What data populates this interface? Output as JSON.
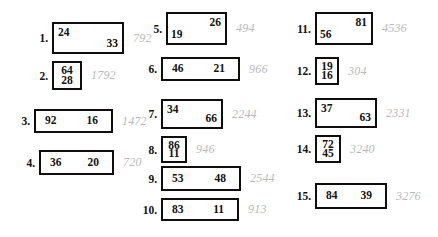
{
  "worksheet": {
    "columns": [
      {
        "name": "column-left",
        "problems": [
          {
            "index": "1.",
            "layout": "diagonal-tl-br",
            "factors": [
              "24",
              "33"
            ],
            "product": "792",
            "box": {
              "width": 72,
              "height": 32
            },
            "pos": {
              "left": 34,
              "top": 22
            },
            "idx_width": 14
          },
          {
            "index": "2.",
            "layout": "stacked",
            "factors": [
              "64",
              "28"
            ],
            "product": "1792",
            "box": {
              "width": 30,
              "height": 29
            },
            "pos": {
              "left": 34,
              "top": 61
            },
            "idx_width": 14
          },
          {
            "index": "3.",
            "layout": "inline",
            "factors": [
              "92",
              "16"
            ],
            "product": "1472",
            "box": {
              "width": 79,
              "height": 24
            },
            "pos": {
              "left": 16,
              "top": 109
            },
            "idx_width": 14
          },
          {
            "index": "4.",
            "layout": "inline",
            "factors": [
              "36",
              "20"
            ],
            "product": "720",
            "box": {
              "width": 75,
              "height": 25
            },
            "pos": {
              "left": 21,
              "top": 150
            },
            "idx_width": 14
          }
        ]
      },
      {
        "name": "column-middle",
        "problems": [
          {
            "index": "5.",
            "layout": "diagonal-tr-bl",
            "factors": [
              "26",
              "19"
            ],
            "product": "494",
            "box": {
              "width": 61,
              "height": 33
            },
            "pos": {
              "left": 148,
              "top": 12
            },
            "idx_width": 14
          },
          {
            "index": "6.",
            "layout": "inline",
            "factors": [
              "46",
              "21"
            ],
            "product": "966",
            "box": {
              "width": 79,
              "height": 24
            },
            "pos": {
              "left": 143,
              "top": 57
            },
            "idx_width": 14
          },
          {
            "index": "7.",
            "layout": "diagonal-tl-br",
            "factors": [
              "34",
              "66"
            ],
            "product": "2244",
            "box": {
              "width": 62,
              "height": 30
            },
            "pos": {
              "left": 143,
              "top": 99
            },
            "idx_width": 14
          },
          {
            "index": "8.",
            "layout": "stacked",
            "factors": [
              "86",
              "11"
            ],
            "product": "946",
            "box": {
              "width": 26,
              "height": 27
            },
            "pos": {
              "left": 143,
              "top": 136
            },
            "idx_width": 14
          },
          {
            "index": "9.",
            "layout": "inline",
            "factors": [
              "53",
              "48"
            ],
            "product": "2544",
            "box": {
              "width": 80,
              "height": 25
            },
            "pos": {
              "left": 143,
              "top": 166
            },
            "idx_width": 14
          },
          {
            "index": "10.",
            "layout": "inline",
            "factors": [
              "83",
              "11"
            ],
            "product": "913",
            "box": {
              "width": 78,
              "height": 23
            },
            "pos": {
              "left": 137,
              "top": 198
            },
            "idx_width": 20
          }
        ]
      },
      {
        "name": "column-right",
        "problems": [
          {
            "index": "11.",
            "layout": "diagonal-tr-bl",
            "factors": [
              "81",
              "56"
            ],
            "product": "4536",
            "box": {
              "width": 58,
              "height": 33
            },
            "pos": {
              "left": 291,
              "top": 12
            },
            "idx_width": 20
          },
          {
            "index": "12.",
            "layout": "stacked",
            "factors": [
              "19",
              "16"
            ],
            "product": "304",
            "box": {
              "width": 24,
              "height": 28
            },
            "pos": {
              "left": 291,
              "top": 57
            },
            "idx_width": 20
          },
          {
            "index": "13.",
            "layout": "diagonal-tl-br",
            "factors": [
              "37",
              "63"
            ],
            "product": "2331",
            "box": {
              "width": 62,
              "height": 30
            },
            "pos": {
              "left": 291,
              "top": 98
            },
            "idx_width": 20
          },
          {
            "index": "14.",
            "layout": "stacked",
            "factors": [
              "72",
              "45"
            ],
            "product": "3240",
            "box": {
              "width": 26,
              "height": 28
            },
            "pos": {
              "left": 291,
              "top": 135
            },
            "idx_width": 20
          },
          {
            "index": "15.",
            "layout": "inline",
            "factors": [
              "84",
              "39"
            ],
            "product": "3276",
            "box": {
              "width": 72,
              "height": 26
            },
            "pos": {
              "left": 291,
              "top": 183
            },
            "idx_width": 20
          }
        ]
      }
    ]
  }
}
